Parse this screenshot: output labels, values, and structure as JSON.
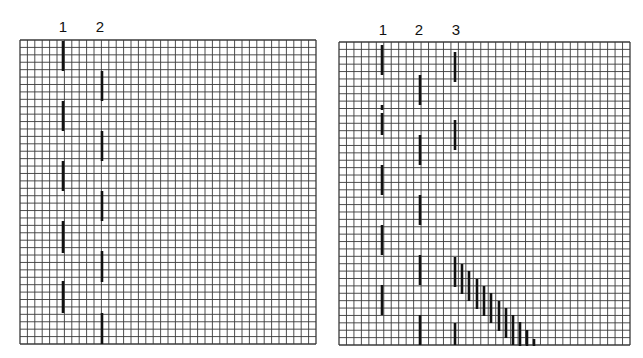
{
  "figure": {
    "background": "#ffffff",
    "grid_line_color": "#3a3a3a",
    "segment_color": "#111111",
    "cell_size_px": 7.4
  },
  "panels": [
    {
      "id": "left",
      "grid": {
        "x": 20,
        "y": 40,
        "width": 296,
        "height": 304,
        "cols": 40,
        "rows": 41
      },
      "columns": [
        {
          "label": "1",
          "x": 63,
          "segments": [
            [
              41,
              71
            ],
            [
              101,
              131
            ],
            [
              161,
              191
            ],
            [
              221,
              253
            ],
            [
              281,
              313
            ]
          ]
        },
        {
          "label": "2",
          "x": 102,
          "segments": [
            [
              71,
              101
            ],
            [
              131,
              161
            ],
            [
              191,
              221
            ],
            [
              251,
              282
            ],
            [
              313,
              344
            ]
          ]
        }
      ],
      "staircase": []
    },
    {
      "id": "right",
      "grid": {
        "x": 339,
        "y": 42,
        "width": 291,
        "height": 303,
        "cols": 39,
        "rows": 41
      },
      "columns": [
        {
          "label": "1",
          "x": 382,
          "segments": [
            [
              45,
              75
            ],
            [
              105,
              110
            ],
            [
              113,
              135
            ],
            [
              165,
              195
            ],
            [
              225,
              255
            ],
            [
              285,
              315
            ]
          ]
        },
        {
          "label": "2",
          "x": 420,
          "segments": [
            [
              75,
              105
            ],
            [
              135,
              165
            ],
            [
              195,
              225
            ],
            [
              255,
              285
            ],
            [
              315,
              345
            ]
          ]
        },
        {
          "label": "3",
          "x": 455,
          "segments": [
            [
              52,
              82
            ],
            [
              120,
              150
            ],
            [
              257,
              287
            ],
            [
              323,
              345
            ]
          ]
        }
      ],
      "staircase": [
        {
          "x": 462,
          "y1": 264,
          "y2": 294
        },
        {
          "x": 469,
          "y1": 271,
          "y2": 301
        },
        {
          "x": 477,
          "y1": 279,
          "y2": 309
        },
        {
          "x": 484,
          "y1": 286,
          "y2": 316
        },
        {
          "x": 491,
          "y1": 293,
          "y2": 323
        },
        {
          "x": 499,
          "y1": 301,
          "y2": 331
        },
        {
          "x": 506,
          "y1": 308,
          "y2": 338
        },
        {
          "x": 513,
          "y1": 315,
          "y2": 345
        },
        {
          "x": 520,
          "y1": 322,
          "y2": 346
        },
        {
          "x": 527,
          "y1": 330,
          "y2": 346
        },
        {
          "x": 534,
          "y1": 339,
          "y2": 346
        }
      ]
    }
  ]
}
